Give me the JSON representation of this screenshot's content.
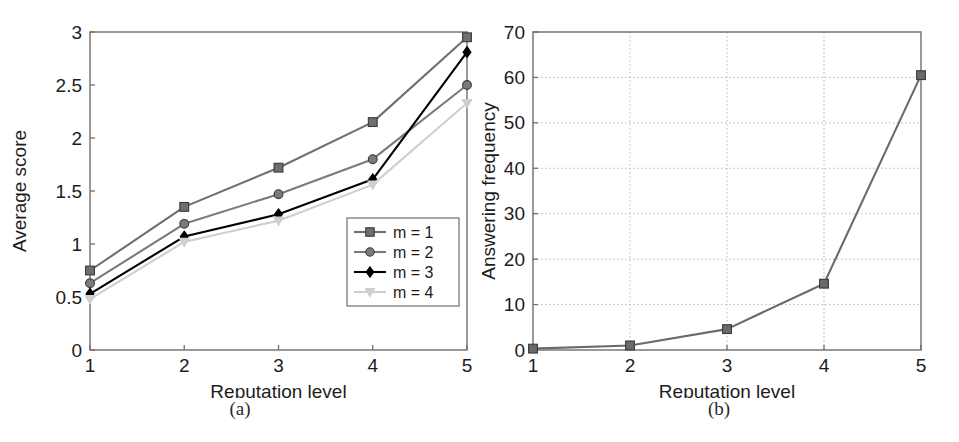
{
  "figure": {
    "panels": [
      {
        "id": "a",
        "caption": "(a)"
      },
      {
        "id": "b",
        "caption": "(b)"
      }
    ]
  },
  "colors": {
    "axis": "#6e6e6e",
    "grid": "#b9b9b9",
    "series_m1": "#6f6f6f",
    "series_m2": "#7a7a7a",
    "series_m3": "#000000",
    "series_m4": "#cfcfcf",
    "series_b": "#6a6a6a",
    "text": "#1c1c1c",
    "background": "#ffffff"
  },
  "chart_data": [
    {
      "type": "line",
      "panel": "a",
      "title": "",
      "xlabel": "Reputation level",
      "ylabel": "Average score",
      "x": [
        1,
        2,
        3,
        4,
        5
      ],
      "xticklabels": [
        "1",
        "2",
        "3",
        "4",
        "5"
      ],
      "yticks": [
        0,
        0.5,
        1,
        1.5,
        2,
        2.5,
        3
      ],
      "yticklabels": [
        "0",
        "0.5",
        "1",
        "1.5",
        "2",
        "2.5",
        "3"
      ],
      "xlim": [
        1,
        5
      ],
      "ylim": [
        0,
        3
      ],
      "grid": false,
      "legend_position": "lower right",
      "series": [
        {
          "name": "m = 1",
          "marker": "square",
          "color": "#6f6f6f",
          "values": [
            0.75,
            1.35,
            1.72,
            2.15,
            2.95
          ]
        },
        {
          "name": "m = 2",
          "marker": "circle",
          "color": "#7a7a7a",
          "values": [
            0.63,
            1.19,
            1.47,
            1.8,
            2.5
          ]
        },
        {
          "name": "m = 3",
          "marker": "diamond",
          "color": "#000000",
          "values": [
            0.53,
            1.07,
            1.28,
            1.61,
            2.81
          ]
        },
        {
          "name": "m = 4",
          "marker": "triangle-down",
          "color": "#cfcfcf",
          "values": [
            0.48,
            1.02,
            1.22,
            1.56,
            2.33
          ]
        }
      ]
    },
    {
      "type": "line",
      "panel": "b",
      "title": "",
      "xlabel": "Reputation level",
      "ylabel": "Answering frequency",
      "x": [
        1,
        2,
        3,
        4,
        5
      ],
      "xticklabels": [
        "1",
        "2",
        "3",
        "4",
        "5"
      ],
      "yticks": [
        0,
        10,
        20,
        30,
        40,
        50,
        60,
        70
      ],
      "yticklabels": [
        "0",
        "10",
        "20",
        "30",
        "40",
        "50",
        "60",
        "70"
      ],
      "xlim": [
        1,
        5
      ],
      "ylim": [
        0,
        70
      ],
      "grid": true,
      "legend_position": "none",
      "series": [
        {
          "name": "answering frequency",
          "marker": "square",
          "color": "#6a6a6a",
          "values": [
            0.3,
            1.0,
            4.6,
            14.6,
            60.5
          ]
        }
      ]
    }
  ]
}
